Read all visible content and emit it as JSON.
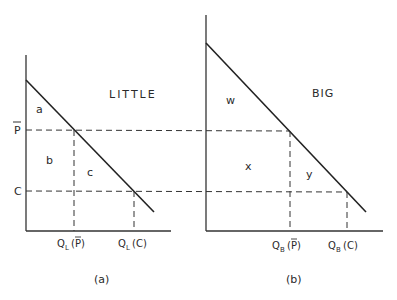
{
  "panel_a": {
    "title": "LITTLE",
    "caption": "(a)",
    "areas": [
      "a",
      "b",
      "c"
    ],
    "y_labels": {
      "p_bar": "P",
      "c": "C"
    },
    "x_labels": {
      "q_pbar_main": "Q",
      "q_pbar_sub": "L",
      "q_pbar_arg": "(P)",
      "q_c_main": "Q",
      "q_c_sub": "L",
      "q_c_arg": "(C)"
    }
  },
  "panel_b": {
    "title": "BIG",
    "caption": "(b)",
    "areas": [
      "w",
      "x",
      "y"
    ],
    "x_labels": {
      "q_pbar_main": "Q",
      "q_pbar_sub": "B",
      "q_pbar_arg": "(P)",
      "q_c_main": "Q",
      "q_c_sub": "B",
      "q_c_arg": "(C)"
    }
  },
  "colors": {
    "line": "#222222",
    "dash": "#333333",
    "text": "#2a2a2a"
  }
}
